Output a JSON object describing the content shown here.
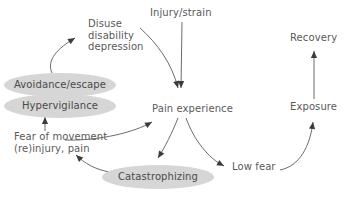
{
  "diagram": {
    "background_color": "#ffffff",
    "text_color": "#5a5a5a",
    "ellipse_fill_color": "#d6d6d6",
    "edge_color": "#6b6b6b",
    "arrowhead_color": "#3c3c3c",
    "nodes": [
      {
        "id": "disuse",
        "label": "Disuse\ndisability\ndepression",
        "shape": "text",
        "x": 88,
        "y": 18,
        "width": 62,
        "height": 38
      },
      {
        "id": "injury_strain",
        "label": "Injury/strain",
        "shape": "text",
        "x": 150,
        "y": 7,
        "width": 64,
        "height": 13
      },
      {
        "id": "recovery",
        "label": "Recovery",
        "shape": "text",
        "x": 290,
        "y": 32,
        "width": 52,
        "height": 13
      },
      {
        "id": "avoidance_escape",
        "label": "Avoidance/escape",
        "shape": "ellipse",
        "x": 4,
        "y": 73,
        "width": 112,
        "height": 24
      },
      {
        "id": "hypervigilance",
        "label": "Hypervigilance",
        "shape": "ellipse",
        "x": 4,
        "y": 94,
        "width": 112,
        "height": 24
      },
      {
        "id": "pain_experience",
        "label": "Pain experience",
        "shape": "text",
        "x": 152,
        "y": 103,
        "width": 84,
        "height": 13
      },
      {
        "id": "exposure",
        "label": "Exposure",
        "shape": "text",
        "x": 290,
        "y": 101,
        "width": 50,
        "height": 13
      },
      {
        "id": "fear_of_movement",
        "label": "Fear of movement\n(re)injury, pain",
        "shape": "text",
        "x": 14,
        "y": 131,
        "width": 96,
        "height": 26
      },
      {
        "id": "catastrophizing",
        "label": "Catastrophizing",
        "shape": "ellipse",
        "x": 102,
        "y": 165,
        "width": 112,
        "height": 24
      },
      {
        "id": "low_fear",
        "label": "Low fear",
        "shape": "text",
        "x": 232,
        "y": 161,
        "width": 46,
        "height": 13
      }
    ],
    "edges": [
      {
        "id": "avoidance-to-disuse",
        "from": "avoidance_escape",
        "to": "disuse",
        "style": "curved",
        "path": "M 52 73 C 46 60 58 48 75 38"
      },
      {
        "id": "disuse-to-pain",
        "from": "disuse",
        "to": "pain_experience",
        "style": "curved",
        "path": "M 140 28 C 158 44 172 64 178 88"
      },
      {
        "id": "injury-to-pain",
        "from": "injury_strain",
        "to": "pain_experience",
        "style": "straight",
        "path": "M 182 22 L 181 88"
      },
      {
        "id": "fear-to-pain",
        "from": "fear_of_movement",
        "to": "pain_experience",
        "style": "curved",
        "path": "M 65 140 C 100 141 135 132 152 122"
      },
      {
        "id": "pain-to-catastrophizing",
        "from": "pain_experience",
        "to": "catastrophizing",
        "style": "curved",
        "path": "M 178 118 C 172 133 165 147 158 158"
      },
      {
        "id": "pain-to-lowfear",
        "from": "pain_experience",
        "to": "low_fear",
        "style": "curved",
        "path": "M 186 118 C 194 140 208 158 224 166"
      },
      {
        "id": "catastrophizing-to-fear",
        "from": "catastrophizing",
        "to": "fear_of_movement",
        "style": "curved",
        "path": "M 110 172 C 96 170 84 163 76 155"
      },
      {
        "id": "fearmovement-to-hypervigilance",
        "from": "fear_of_movement",
        "to": "hypervigilance",
        "style": "straight",
        "path": "M 45 131 L 45 117"
      },
      {
        "id": "lowfear-to-exposure",
        "from": "low_fear",
        "to": "exposure",
        "style": "curved",
        "path": "M 280 170 C 300 166 310 146 313 122"
      },
      {
        "id": "exposure-to-recovery",
        "from": "exposure",
        "to": "recovery",
        "style": "straight",
        "path": "M 314 99 L 314 51"
      }
    ]
  }
}
